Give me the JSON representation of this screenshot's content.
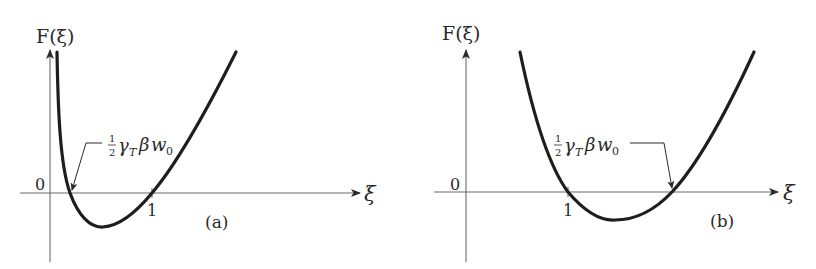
{
  "panels": [
    {
      "id": "a",
      "y_axis_label": "F(ξ)",
      "x_axis_label": "ξ",
      "origin_label": "0",
      "tick_label": "1",
      "panel_label": "(a)",
      "annotation": {
        "frac": "1",
        "den": "2",
        "gamma": "γ",
        "sub_T": "T",
        "beta": "β",
        "w": "w",
        "sub_0": "0"
      }
    },
    {
      "id": "b",
      "y_axis_label": "F(ξ)",
      "x_axis_label": "ξ",
      "origin_label": "0",
      "tick_label": "1",
      "panel_label": "(b)",
      "annotation": {
        "frac": "1",
        "den": "2",
        "gamma": "γ",
        "sub_T": "T",
        "beta": "β",
        "w": "w",
        "sub_0": "0"
      }
    }
  ],
  "colors": {
    "curve": "#1e1e1e",
    "axis": "#6a6a6a",
    "text": "#2a2a2a"
  }
}
